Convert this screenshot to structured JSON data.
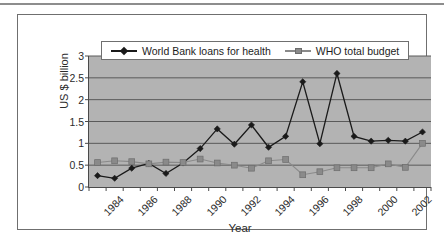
{
  "figure": {
    "y_axis_title": "US $ billion",
    "x_axis_title": "Year",
    "legend": [
      {
        "label": "World Bank loans for health",
        "marker": "diamond-marker",
        "color": "#1a1a1a"
      },
      {
        "label": "WHO total budget",
        "marker": "square-marker",
        "color": "#8a8a8a"
      }
    ]
  },
  "chart_data": {
    "type": "line",
    "title": "",
    "xlabel": "Year",
    "ylabel": "US $ billion",
    "xlim": [
      1984,
      2004
    ],
    "ylim": [
      0,
      3
    ],
    "yticks": [
      "0",
      "0.5",
      "1",
      "1.5",
      "2",
      "2.5",
      "3"
    ],
    "ytick_values": [
      0,
      0.5,
      1,
      1.5,
      2,
      2.5,
      3
    ],
    "xticks": [
      "1984",
      "1986",
      "1988",
      "1990",
      "1992",
      "1994",
      "1996",
      "1998",
      "2000",
      "2002"
    ],
    "xtick_values": [
      1984,
      1986,
      1988,
      1990,
      1992,
      1994,
      1996,
      1998,
      2000,
      2002
    ],
    "grid": "horizontal",
    "legend_position": "top-center",
    "plot_background": "#b3b3b3",
    "x": [
      1984.5,
      1985.5,
      1986.5,
      1987.5,
      1988.5,
      1989.5,
      1990.5,
      1991.5,
      1992.5,
      1993.5,
      1994.5,
      1995.5,
      1996.5,
      1997.5,
      1998.5,
      1999.5,
      2000.5,
      2001.5,
      2002.5,
      2003.5
    ],
    "series": [
      {
        "name": "World Bank loans for health",
        "color": "#1a1a1a",
        "marker": "diamond",
        "values": [
          0.26,
          0.2,
          0.43,
          0.54,
          0.31,
          0.55,
          0.88,
          1.33,
          0.98,
          1.42,
          0.91,
          1.16,
          2.41,
          0.99,
          2.6,
          1.16,
          1.05,
          1.07,
          1.05,
          1.26
        ]
      },
      {
        "name": "WHO total budget",
        "color": "#8a8a8a",
        "marker": "square",
        "values": [
          0.56,
          0.6,
          0.58,
          0.53,
          0.57,
          0.56,
          0.64,
          0.55,
          0.5,
          0.43,
          0.6,
          0.63,
          0.28,
          0.35,
          0.44,
          0.44,
          0.44,
          0.53,
          0.45,
          1.0
        ]
      }
    ]
  }
}
